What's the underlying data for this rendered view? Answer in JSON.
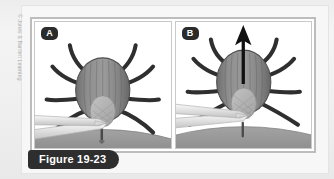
{
  "figure": {
    "caption": "Figure 19-23",
    "credit": "© Jones & Bartlett Learning",
    "panels": [
      {
        "badge": "A",
        "alt": "Tweezers grasping a tick as close to the skin surface as possible",
        "arrow": false
      },
      {
        "badge": "B",
        "alt": "Tick being pulled straight upward away from the skin with steady even pressure",
        "arrow": true
      }
    ]
  },
  "colors": {
    "page_background": "#f0f0f0",
    "card_background": "#f7f7f7",
    "panel_background": "#ffffff",
    "frame_border": "#bdbdbd",
    "badge_background": "#2b2b2b",
    "badge_text": "#ffffff",
    "caption_background": "#2e2e2e",
    "caption_text": "#ffffff",
    "credit_text": "#a9a9a9",
    "tick_body": "#8d8d8d",
    "tick_body_dark": "#6f6f6f",
    "tick_scutum": "#b4b4b4",
    "tick_leg": "#2f2f2f",
    "skin": "#9a9a9a",
    "skin_shadow": "#8a8a8a",
    "tweezers": "#e8e8e8",
    "tweezers_edge": "#b9b9b9",
    "arrow": "#111111"
  }
}
